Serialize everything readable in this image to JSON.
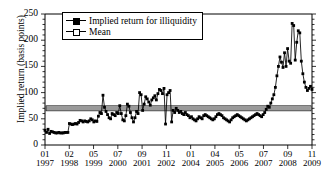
{
  "chart_data": {
    "type": "line",
    "title": "",
    "xlabel": "",
    "ylabel": "Implied return (basis points)",
    "ylim": [
      0,
      250
    ],
    "yticks": [
      0,
      50,
      100,
      150,
      200,
      250
    ],
    "yticks_minor_step": 10,
    "grid": false,
    "legend_position": "top-left",
    "legend": [
      {
        "name": "Implied return for illiquidity",
        "marker": "filled-square",
        "line": "solid"
      },
      {
        "name": "Mean",
        "marker": "open-square",
        "line": "solid"
      }
    ],
    "xticks": [
      {
        "month": "01",
        "year": "1997"
      },
      {
        "month": "02",
        "year": "1998"
      },
      {
        "month": "05",
        "year": "1999"
      },
      {
        "month": "07",
        "year": "2000"
      },
      {
        "month": "09",
        "year": "2001"
      },
      {
        "month": "11",
        "year": "2002"
      },
      {
        "month": "01",
        "year": "2004"
      },
      {
        "month": "04",
        "year": "2005"
      },
      {
        "month": "05",
        "year": "2006"
      },
      {
        "month": "07",
        "year": "2007"
      },
      {
        "month": "09",
        "year": "2008"
      },
      {
        "month": "11",
        "year": "2009"
      }
    ],
    "series": [
      {
        "name": "Implied return for illiquidity",
        "marker": "filled-square",
        "values": [
          28,
          24,
          30,
          22,
          26,
          25,
          24,
          23,
          23,
          24,
          23,
          23,
          23,
          24,
          24,
          24,
          41,
          40,
          39,
          40,
          41,
          40,
          43,
          47,
          46,
          44,
          46,
          45,
          44,
          46,
          50,
          48,
          44,
          46,
          45,
          55,
          62,
          60,
          95,
          72,
          64,
          58,
          52,
          50,
          60,
          58,
          56,
          62,
          60,
          75,
          60,
          48,
          46,
          56,
          78,
          74,
          62,
          52,
          44,
          52,
          64,
          60,
          100,
          96,
          66,
          78,
          92,
          88,
          82,
          76,
          86,
          90,
          94,
          86,
          98,
          106,
          104,
          98,
          108,
          40,
          96,
          100,
          104,
          44,
          66,
          62,
          70,
          66,
          62,
          64,
          60,
          58,
          62,
          58,
          56,
          52,
          54,
          50,
          48,
          46,
          50,
          54,
          52,
          50,
          56,
          58,
          56,
          54,
          52,
          50,
          48,
          50,
          54,
          58,
          60,
          58,
          56,
          52,
          50,
          48,
          46,
          44,
          48,
          52,
          54,
          56,
          58,
          56,
          54,
          52,
          50,
          48,
          46,
          48,
          50,
          52,
          54,
          56,
          58,
          60,
          58,
          56,
          54,
          58,
          62,
          68,
          74,
          72,
          80,
          88,
          96,
          110,
          132,
          150,
          168,
          158,
          148,
          176,
          150,
          184,
          160,
          156,
          232,
          228,
          162,
          196,
          218,
          214,
          160,
          136,
          120,
          110,
          104,
          108,
          112,
          106
        ]
      },
      {
        "name": "Mean",
        "marker": "open-square",
        "constant_value": 70
      }
    ]
  }
}
